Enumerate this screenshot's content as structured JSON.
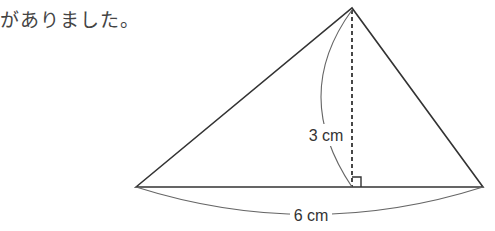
{
  "text": {
    "intro": "がありました。"
  },
  "figure": {
    "type": "triangle",
    "height_label": "3 cm",
    "base_label": "6 cm",
    "colors": {
      "line": "#333333",
      "curve": "#666666"
    }
  }
}
